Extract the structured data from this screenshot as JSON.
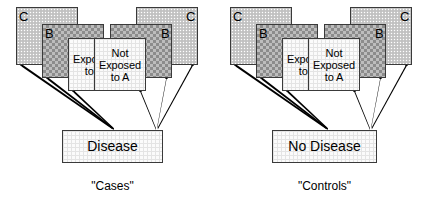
{
  "diagram": {
    "title_visible": false,
    "panels": [
      {
        "id": "cases",
        "caption": "\"Cases\"",
        "outcome": "Disease",
        "groups": [
          {
            "id": "cases-exposed",
            "mirrored": false,
            "layers": [
              {
                "name": "C",
                "label": "C"
              },
              {
                "name": "B",
                "label": "B"
              },
              {
                "name": "A",
                "label": "Exposed\nto A"
              }
            ]
          },
          {
            "id": "cases-unexposed",
            "mirrored": true,
            "layers": [
              {
                "name": "C",
                "label": "C"
              },
              {
                "name": "B",
                "label": "B"
              },
              {
                "name": "A",
                "label": "Not\nExposed\nto A"
              }
            ]
          }
        ]
      },
      {
        "id": "controls",
        "caption": "\"Controls\"",
        "outcome": "No Disease",
        "groups": [
          {
            "id": "controls-exposed",
            "mirrored": false,
            "layers": [
              {
                "name": "C",
                "label": "C"
              },
              {
                "name": "B",
                "label": "B"
              },
              {
                "name": "A",
                "label": "Exposed\nto A"
              }
            ]
          },
          {
            "id": "controls-unexposed",
            "mirrored": true,
            "layers": [
              {
                "name": "C",
                "label": "C"
              },
              {
                "name": "B",
                "label": "B"
              },
              {
                "name": "A",
                "label": "Not\nExposed\nto A"
              }
            ]
          }
        ]
      }
    ],
    "colors": {
      "background": "#ffffff",
      "box_border": "#3a3a3a",
      "layer_c_fill": "#c9c9c9",
      "layer_b_fill": "#bdbdbd",
      "layer_a_fill": "#fbfbfb",
      "line": "#000000",
      "text": "#000000"
    }
  }
}
